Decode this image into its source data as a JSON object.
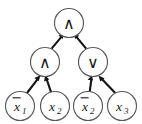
{
  "diagram": {
    "kind": "boolean-expression-tree",
    "background_color": "#ffffff",
    "node_stroke_color": "#59595b",
    "edge_color": "#151515",
    "text_color": "#1a1a1a",
    "root": {
      "id": "root",
      "label": "∧",
      "operator_name": "and",
      "cx": 69,
      "cy": 23,
      "r": 14.5
    },
    "internal": [
      {
        "id": "internal-and",
        "label": "∧",
        "operator_name": "and",
        "cx": 45,
        "cy": 62,
        "r": 14.5
      },
      {
        "id": "internal-or",
        "label": "∨",
        "operator_name": "or",
        "cx": 93,
        "cy": 62,
        "r": 14.5
      }
    ],
    "leaves": [
      {
        "id": "leaf-not-x1",
        "base": "x",
        "subscript": "1",
        "negated": true,
        "display": "x̄1",
        "cx": 20,
        "cy": 106,
        "r": 14.5
      },
      {
        "id": "leaf-x2",
        "base": "x",
        "subscript": "2",
        "negated": false,
        "display": "x2",
        "cx": 55,
        "cy": 106,
        "r": 14.5
      },
      {
        "id": "leaf-not-x2",
        "base": "x",
        "subscript": "2",
        "negated": true,
        "display": "x̄2",
        "cx": 88,
        "cy": 106,
        "r": 14.5
      },
      {
        "id": "leaf-x3",
        "base": "x",
        "subscript": "3",
        "negated": false,
        "display": "x3",
        "cx": 122,
        "cy": 106,
        "r": 14.5
      }
    ],
    "edges": [
      {
        "id": "edge-and-to-root",
        "from": "internal-and",
        "to": "root",
        "arrow": "to"
      },
      {
        "id": "edge-or-to-root",
        "from": "internal-or",
        "to": "root",
        "arrow": "to"
      },
      {
        "id": "edge-notx1-to-and",
        "from": "leaf-not-x1",
        "to": "internal-and",
        "arrow": "to"
      },
      {
        "id": "edge-x2-to-and",
        "from": "leaf-x2",
        "to": "internal-and",
        "arrow": "to"
      },
      {
        "id": "edge-notx2-to-or",
        "from": "leaf-not-x2",
        "to": "internal-or",
        "arrow": "to"
      },
      {
        "id": "edge-x3-to-or",
        "from": "leaf-x3",
        "to": "internal-or",
        "arrow": "to"
      }
    ]
  }
}
